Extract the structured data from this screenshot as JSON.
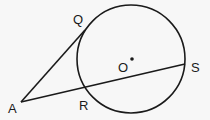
{
  "diagram": {
    "colors": {
      "stroke": "#1a1a1a",
      "background": "#f7f7f7"
    },
    "circle": {
      "center_label": "O",
      "cx": 131,
      "cy": 59,
      "r": 54
    },
    "points": {
      "A": {
        "label": "A",
        "x": 21,
        "y": 102
      },
      "Q": {
        "label": "Q",
        "x": 85,
        "y": 30
      },
      "R": {
        "label": "R",
        "x": 85,
        "y": 88
      },
      "S": {
        "label": "S",
        "x": 185,
        "y": 64
      },
      "O": {
        "label": "O",
        "x": 132,
        "y": 59
      }
    },
    "segments": [
      {
        "name": "tangent-AQ",
        "from": "A",
        "to": "Q"
      },
      {
        "name": "secant-AS",
        "from": "A",
        "to": "S"
      }
    ]
  }
}
